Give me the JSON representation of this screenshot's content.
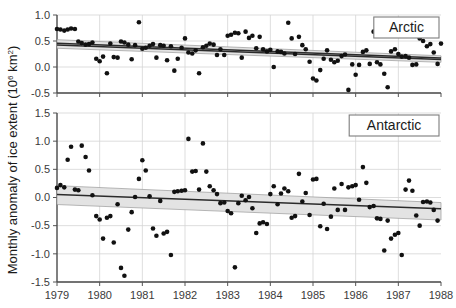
{
  "chart_data": {
    "type": "scatter",
    "title": "",
    "xlabel": "",
    "ylabel": "Monthly anomaly of ice extent (10⁶ km²)",
    "ylabel_main": "Monthly anomaly of ice extent (10",
    "ylabel_exp": "6",
    "ylabel_tail": " km",
    "ylabel_exp2": "2",
    "ylabel_close": ")",
    "grid": true,
    "legend_position": "top-right inside each panel",
    "xlim": [
      1979,
      1988
    ],
    "xticks": [
      1979,
      1980,
      1981,
      1982,
      1983,
      1984,
      1985,
      1986,
      1987,
      1988
    ],
    "xtick_labels": [
      "1979",
      "1980",
      "1981",
      "1982",
      "1983",
      "1984",
      "1985",
      "1986",
      "1987",
      "1988"
    ],
    "panels": [
      {
        "label": "Arctic",
        "ylim": [
          -0.5,
          1.0
        ],
        "yticks": [
          -0.5,
          0.0,
          0.5,
          1.0
        ],
        "ytick_labels": [
          "-0.5",
          "0.0",
          "0.5",
          "1.0"
        ],
        "trend": {
          "description": "two near-parallel declining regression lines with shaded 95% confidence band",
          "line1": {
            "x0": 1979.0,
            "y0": 0.455,
            "x1": 1988.0,
            "y1": 0.175
          },
          "line2": {
            "x0": 1979.0,
            "y0": 0.425,
            "x1": 1988.0,
            "y1": 0.145
          },
          "band_upper": {
            "x0": 1979.0,
            "y0": 0.525,
            "x1": 1988.0,
            "y1": 0.215
          },
          "band_lower": {
            "x0": 1979.0,
            "y0": 0.36,
            "x1": 1988.0,
            "y1": 0.09
          }
        },
        "points": [
          [
            1979.0,
            0.73
          ],
          [
            1979.08,
            0.72
          ],
          [
            1979.17,
            0.7
          ],
          [
            1979.25,
            0.72
          ],
          [
            1979.33,
            0.74
          ],
          [
            1979.42,
            0.73
          ],
          [
            1979.5,
            0.49
          ],
          [
            1979.58,
            0.46
          ],
          [
            1979.67,
            0.43
          ],
          [
            1979.75,
            0.44
          ],
          [
            1979.83,
            0.47
          ],
          [
            1979.92,
            0.16
          ],
          [
            1980.0,
            0.11
          ],
          [
            1980.08,
            0.2
          ],
          [
            1980.17,
            -0.12
          ],
          [
            1980.25,
            0.45
          ],
          [
            1980.33,
            0.19
          ],
          [
            1980.42,
            0.18
          ],
          [
            1980.5,
            0.49
          ],
          [
            1980.58,
            0.47
          ],
          [
            1980.67,
            0.43
          ],
          [
            1980.75,
            0.15
          ],
          [
            1980.83,
            0.42
          ],
          [
            1980.92,
            0.86
          ],
          [
            1981.0,
            0.35
          ],
          [
            1981.08,
            0.37
          ],
          [
            1981.17,
            0.41
          ],
          [
            1981.25,
            0.44
          ],
          [
            1981.33,
            0.18
          ],
          [
            1981.42,
            0.42
          ],
          [
            1981.5,
            0.41
          ],
          [
            1981.58,
            0.13
          ],
          [
            1981.67,
            0.4
          ],
          [
            1981.75,
            -0.07
          ],
          [
            1981.83,
            0.16
          ],
          [
            1981.92,
            0.37
          ],
          [
            1982.0,
            0.55
          ],
          [
            1982.08,
            0.28
          ],
          [
            1982.17,
            0.26
          ],
          [
            1982.25,
            0.32
          ],
          [
            1982.33,
            -0.12
          ],
          [
            1982.42,
            0.38
          ],
          [
            1982.5,
            0.41
          ],
          [
            1982.58,
            0.45
          ],
          [
            1982.67,
            0.43
          ],
          [
            1982.75,
            0.23
          ],
          [
            1982.83,
            0.34
          ],
          [
            1982.92,
            0.23
          ],
          [
            1983.0,
            0.6
          ],
          [
            1983.08,
            0.62
          ],
          [
            1983.17,
            0.66
          ],
          [
            1983.25,
            0.65
          ],
          [
            1983.33,
            0.18
          ],
          [
            1983.42,
            0.68
          ],
          [
            1983.5,
            0.56
          ],
          [
            1983.58,
            0.6
          ],
          [
            1983.67,
            0.36
          ],
          [
            1983.75,
            0.58
          ],
          [
            1983.83,
            0.34
          ],
          [
            1983.92,
            0.3
          ],
          [
            1984.0,
            0.33
          ],
          [
            1984.08,
            0.0
          ],
          [
            1984.17,
            0.3
          ],
          [
            1984.25,
            0.29
          ],
          [
            1984.33,
            0.26
          ],
          [
            1984.42,
            0.85
          ],
          [
            1984.5,
            0.55
          ],
          [
            1984.58,
            0.25
          ],
          [
            1984.67,
            0.58
          ],
          [
            1984.75,
            0.42
          ],
          [
            1984.83,
            0.34
          ],
          [
            1984.92,
            0.1
          ],
          [
            1985.0,
            -0.22
          ],
          [
            1985.08,
            -0.26
          ],
          [
            1985.17,
            -0.06
          ],
          [
            1985.25,
            0.16
          ],
          [
            1985.33,
            0.32
          ],
          [
            1985.42,
            0.14
          ],
          [
            1985.5,
            0.09
          ],
          [
            1985.58,
            0.12
          ],
          [
            1985.67,
            0.21
          ],
          [
            1985.75,
            0.24
          ],
          [
            1985.83,
            -0.44
          ],
          [
            1985.92,
            0.05
          ],
          [
            1986.0,
            -0.15
          ],
          [
            1986.08,
            0.04
          ],
          [
            1986.17,
            0.29
          ],
          [
            1986.25,
            0.32
          ],
          [
            1986.33,
            0.06
          ],
          [
            1986.42,
            0.68
          ],
          [
            1986.5,
            0.09
          ],
          [
            1986.58,
            0.05
          ],
          [
            1986.67,
            -0.13
          ],
          [
            1986.75,
            -0.39
          ],
          [
            1986.83,
            0.3
          ],
          [
            1986.92,
            0.34
          ],
          [
            1987.0,
            0.25
          ],
          [
            1987.08,
            0.2
          ],
          [
            1987.17,
            0.21
          ],
          [
            1987.25,
            0.18
          ],
          [
            1987.33,
            0.04
          ],
          [
            1987.42,
            0.05
          ],
          [
            1987.5,
            0.55
          ],
          [
            1987.58,
            0.5
          ],
          [
            1987.67,
            0.4
          ],
          [
            1987.75,
            0.44
          ],
          [
            1987.83,
            0.28
          ],
          [
            1987.92,
            0.06
          ],
          [
            1988.0,
            0.45
          ],
          [
            1988.08,
            0.33
          ],
          [
            1988.17,
            0.27
          ],
          [
            1988.25,
            0.26
          ],
          [
            1988.33,
            0.48
          ],
          [
            1988.42,
            -0.07
          ],
          [
            1988.5,
            0.05
          ],
          [
            1988.58,
            0.02
          ],
          [
            1988.67,
            0.23
          ]
        ]
      },
      {
        "label": "Antarctic",
        "ylim": [
          -1.5,
          1.5
        ],
        "yticks": [
          -1.5,
          -1.0,
          -0.5,
          0.0,
          0.5,
          1.0,
          1.5
        ],
        "ytick_labels": [
          "-1.5",
          "-1.0",
          "-0.5",
          "0.0",
          "0.5",
          "1.0",
          "1.5"
        ],
        "trend": {
          "description": "declining regression line with shaded 95% confidence band, wider at the ends",
          "line1": {
            "x0": 1979.0,
            "y0": 0.055,
            "x1": 1988.0,
            "y1": -0.2
          },
          "band_upper": {
            "x0": 1979.0,
            "y0": 0.21,
            "x1": 1988.0,
            "y1": -0.09
          },
          "band_lower": {
            "x0": 1979.0,
            "y0": -0.125,
            "x1": 1988.0,
            "y1": -0.4
          }
        },
        "points": [
          [
            1979.0,
            0.17
          ],
          [
            1979.08,
            0.22
          ],
          [
            1979.17,
            0.18
          ],
          [
            1979.25,
            0.67
          ],
          [
            1979.33,
            0.9
          ],
          [
            1979.42,
            0.14
          ],
          [
            1979.5,
            0.13
          ],
          [
            1979.58,
            0.92
          ],
          [
            1979.67,
            0.72
          ],
          [
            1979.75,
            0.48
          ],
          [
            1979.83,
            0.04
          ],
          [
            1979.92,
            -0.33
          ],
          [
            1980.0,
            -0.39
          ],
          [
            1980.08,
            -0.73
          ],
          [
            1980.17,
            -0.36
          ],
          [
            1980.25,
            -0.33
          ],
          [
            1980.33,
            -0.8
          ],
          [
            1980.42,
            -0.12
          ],
          [
            1980.5,
            -1.25
          ],
          [
            1980.58,
            -1.39
          ],
          [
            1980.67,
            -0.57
          ],
          [
            1980.75,
            -0.26
          ],
          [
            1980.83,
            0.01
          ],
          [
            1980.92,
            0.33
          ],
          [
            1981.0,
            0.66
          ],
          [
            1981.08,
            0.48
          ],
          [
            1981.17,
            0.02
          ],
          [
            1981.25,
            -0.55
          ],
          [
            1981.33,
            -0.68
          ],
          [
            1981.42,
            -0.06
          ],
          [
            1981.5,
            -0.64
          ],
          [
            1981.58,
            -0.61
          ],
          [
            1981.67,
            -1.02
          ],
          [
            1981.75,
            0.1
          ],
          [
            1981.83,
            0.11
          ],
          [
            1981.92,
            0.12
          ],
          [
            1982.0,
            0.13
          ],
          [
            1982.08,
            1.04
          ],
          [
            1982.17,
            0.46
          ],
          [
            1982.25,
            0.47
          ],
          [
            1982.33,
            0.14
          ],
          [
            1982.42,
            0.96
          ],
          [
            1982.5,
            0.46
          ],
          [
            1982.58,
            0.2
          ],
          [
            1982.67,
            0.13
          ],
          [
            1982.75,
            0.06
          ],
          [
            1982.83,
            -0.1
          ],
          [
            1982.92,
            -0.09
          ],
          [
            1983.0,
            -0.24
          ],
          [
            1983.08,
            -0.28
          ],
          [
            1983.17,
            -1.24
          ],
          [
            1983.25,
            -0.1
          ],
          [
            1983.33,
            0.03
          ],
          [
            1983.42,
            -0.05
          ],
          [
            1983.5,
            0.01
          ],
          [
            1983.58,
            -0.19
          ],
          [
            1983.67,
            -0.63
          ],
          [
            1983.75,
            -0.46
          ],
          [
            1983.83,
            -0.44
          ],
          [
            1983.92,
            -0.47
          ],
          [
            1984.0,
            0.06
          ],
          [
            1984.08,
            0.2
          ],
          [
            1984.17,
            -0.12
          ],
          [
            1984.25,
            0.07
          ],
          [
            1984.33,
            0.16
          ],
          [
            1984.42,
            0.11
          ],
          [
            1984.5,
            -0.36
          ],
          [
            1984.58,
            -0.33
          ],
          [
            1984.67,
            0.42
          ],
          [
            1984.75,
            -0.07
          ],
          [
            1984.83,
            0.08
          ],
          [
            1984.92,
            -0.31
          ],
          [
            1985.0,
            0.32
          ],
          [
            1985.08,
            0.33
          ],
          [
            1985.17,
            -0.51
          ],
          [
            1985.25,
            -0.11
          ],
          [
            1985.33,
            -0.56
          ],
          [
            1985.42,
            -0.34
          ],
          [
            1985.5,
            0.16
          ],
          [
            1985.58,
            -0.22
          ],
          [
            1985.67,
            0.24
          ],
          [
            1985.75,
            -0.22
          ],
          [
            1985.83,
            0.18
          ],
          [
            1985.92,
            0.2
          ],
          [
            1986.0,
            0.22
          ],
          [
            1986.08,
            -0.04
          ],
          [
            1986.17,
            0.54
          ],
          [
            1986.25,
            0.26
          ],
          [
            1986.33,
            -0.17
          ],
          [
            1986.42,
            -0.15
          ],
          [
            1986.5,
            -0.37
          ],
          [
            1986.58,
            -0.38
          ],
          [
            1986.67,
            -0.94
          ],
          [
            1986.75,
            -0.41
          ],
          [
            1986.83,
            -0.73
          ],
          [
            1986.92,
            -0.66
          ],
          [
            1987.0,
            -0.63
          ],
          [
            1987.08,
            -1.02
          ],
          [
            1987.17,
            0.14
          ],
          [
            1987.25,
            0.3
          ],
          [
            1987.33,
            0.12
          ],
          [
            1987.42,
            -0.32
          ],
          [
            1987.5,
            -0.5
          ],
          [
            1987.58,
            -0.08
          ],
          [
            1987.67,
            -0.07
          ],
          [
            1987.75,
            -0.09
          ],
          [
            1987.83,
            -0.22
          ],
          [
            1987.92,
            -0.41
          ]
        ]
      }
    ]
  }
}
